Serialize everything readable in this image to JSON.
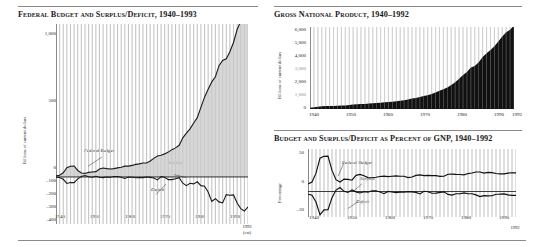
{
  "page": {
    "background": "#ffffff",
    "accent": "#111111",
    "fill_gray": "#c9c9c9",
    "fill_black": "#111111",
    "grid_color": "#c4c4c4"
  },
  "charts": [
    {
      "id": "federal-budget",
      "title": "Federal Budget and Surplus/Deficit, 1940–1993",
      "ylabel": "Billions of current dollars",
      "xlabel": "",
      "type": "area",
      "grid": "vertical-yearly",
      "ylim": [
        -400,
        1300
      ],
      "xlim": [
        1940,
        1993
      ],
      "yticks": [
        "1,000",
        "500",
        "0",
        "–100",
        "–200",
        "–300",
        "–400"
      ],
      "ytick_values": [
        1000,
        500,
        0,
        -100,
        -200,
        -300,
        -400
      ],
      "xticks": [
        "1940",
        "1950",
        "1960",
        "1970",
        "1980",
        "1990"
      ],
      "xtick_values": [
        1940,
        1950,
        1960,
        1970,
        1980,
        1990
      ],
      "endnote": "1993\n(est)",
      "endnote_line1": "1993",
      "endnote_line2": "(est)",
      "series_labels": [
        {
          "name": "Federal Budget",
          "text": "Federal Budget"
        },
        {
          "name": "Surplus",
          "text": "Surplus"
        },
        {
          "name": "Deficit",
          "text": "Deficit"
        }
      ],
      "series": [
        {
          "name": "Federal Budget",
          "x": [
            1940,
            1941,
            1942,
            1943,
            1944,
            1945,
            1946,
            1947,
            1948,
            1949,
            1950,
            1951,
            1952,
            1953,
            1954,
            1955,
            1956,
            1957,
            1958,
            1959,
            1960,
            1961,
            1962,
            1963,
            1964,
            1965,
            1966,
            1967,
            1968,
            1969,
            1970,
            1971,
            1972,
            1973,
            1974,
            1975,
            1976,
            1977,
            1978,
            1979,
            1980,
            1981,
            1982,
            1983,
            1984,
            1985,
            1986,
            1987,
            1988,
            1989,
            1990,
            1991,
            1992,
            1993
          ],
          "values": [
            9,
            14,
            35,
            78,
            91,
            93,
            55,
            34,
            30,
            39,
            42,
            45,
            68,
            76,
            71,
            68,
            71,
            77,
            82,
            92,
            92,
            98,
            107,
            111,
            119,
            118,
            135,
            158,
            178,
            184,
            196,
            211,
            232,
            247,
            269,
            332,
            372,
            409,
            459,
            504,
            591,
            678,
            746,
            808,
            852,
            946,
            990,
            1004,
            1064,
            1143,
            1253,
            1324,
            1382,
            1468
          ]
        },
        {
          "name": "Surplus/Deficit",
          "x": [
            1940,
            1941,
            1942,
            1943,
            1944,
            1945,
            1946,
            1947,
            1948,
            1949,
            1950,
            1951,
            1952,
            1953,
            1954,
            1955,
            1956,
            1957,
            1958,
            1959,
            1960,
            1961,
            1962,
            1963,
            1964,
            1965,
            1966,
            1967,
            1968,
            1969,
            1970,
            1971,
            1972,
            1973,
            1974,
            1975,
            1976,
            1977,
            1978,
            1979,
            1980,
            1981,
            1982,
            1983,
            1984,
            1985,
            1986,
            1987,
            1988,
            1989,
            1990,
            1991,
            1992,
            1993
          ],
          "values": [
            -3,
            -5,
            -20,
            -55,
            -48,
            -48,
            -16,
            4,
            12,
            1,
            -3,
            6,
            -2,
            -6,
            -1,
            -3,
            4,
            3,
            -3,
            -13,
            0,
            -3,
            -7,
            -5,
            -6,
            -1,
            -4,
            -9,
            -25,
            3,
            -3,
            -23,
            -23,
            -15,
            -6,
            -53,
            -74,
            -54,
            -59,
            -41,
            -74,
            -79,
            -128,
            -208,
            -185,
            -212,
            -221,
            -150,
            -155,
            -153,
            -221,
            -269,
            -290,
            -255
          ]
        }
      ]
    },
    {
      "id": "gross-national-product",
      "title": "Gross National Product, 1940–1992",
      "ylabel": "Billions of current dollars",
      "xlabel": "",
      "type": "area",
      "grid": "vertical-yearly",
      "ylim": [
        0,
        6200
      ],
      "xlim": [
        1940,
        1992
      ],
      "yticks": [
        "6,000",
        "5,000",
        "4,000",
        "3,000",
        "2,000",
        "1,000",
        "0"
      ],
      "ytick_values": [
        6000,
        5000,
        4000,
        3000,
        2000,
        1000,
        0
      ],
      "xticks": [
        "1940",
        "1950",
        "1960",
        "1970",
        "1980",
        "1990",
        "1992"
      ],
      "xtick_values": [
        1940,
        1950,
        1960,
        1970,
        1980,
        1990,
        1992
      ],
      "series": [
        {
          "name": "GNP",
          "x": [
            1940,
            1941,
            1942,
            1943,
            1944,
            1945,
            1946,
            1947,
            1948,
            1949,
            1950,
            1951,
            1952,
            1953,
            1954,
            1955,
            1956,
            1957,
            1958,
            1959,
            1960,
            1961,
            1962,
            1963,
            1964,
            1965,
            1966,
            1967,
            1968,
            1969,
            1970,
            1971,
            1972,
            1973,
            1974,
            1975,
            1976,
            1977,
            1978,
            1979,
            1980,
            1981,
            1982,
            1983,
            1984,
            1985,
            1986,
            1987,
            1988,
            1989,
            1990,
            1991,
            1992
          ],
          "values": [
            101,
            126,
            162,
            199,
            220,
            223,
            222,
            244,
            270,
            267,
            294,
            339,
            358,
            379,
            381,
            415,
            438,
            461,
            467,
            507,
            527,
            545,
            586,
            618,
            664,
            720,
            788,
            833,
            910,
            985,
            1039,
            1128,
            1241,
            1386,
            1501,
            1635,
            1824,
            2031,
            2295,
            2566,
            2796,
            3131,
            3259,
            3535,
            3933,
            4213,
            4453,
            4742,
            5108,
            5489,
            5803,
            5986,
            6319
          ]
        }
      ]
    },
    {
      "id": "budget-percent-gnp",
      "title": "Budget and Surplus/Deficit as Percent of GNP, 1940–1992",
      "ylabel": "Percentage",
      "xlabel": "",
      "type": "line",
      "grid": "vertical-yearly",
      "ylim": [
        -30,
        50
      ],
      "xlim": [
        1940,
        1992
      ],
      "yticks": [
        "50",
        "0",
        "–30"
      ],
      "ytick_values": [
        50,
        0,
        -30
      ],
      "xticks": [
        "1940",
        "1950",
        "1960",
        "1970",
        "1980",
        "1990"
      ],
      "xtick_values": [
        1940,
        1950,
        1960,
        1970,
        1980,
        1990
      ],
      "endnote_line1": "1992",
      "series_labels": [
        {
          "name": "Federal Budget",
          "text": "Federal Budget"
        },
        {
          "name": "Surplus",
          "text": "Surplus"
        },
        {
          "name": "Deficit",
          "text": "Deficit"
        }
      ],
      "series": [
        {
          "name": "Federal Budget",
          "x": [
            1940,
            1941,
            1942,
            1943,
            1944,
            1945,
            1946,
            1947,
            1948,
            1949,
            1950,
            1951,
            1952,
            1953,
            1954,
            1955,
            1956,
            1957,
            1958,
            1959,
            1960,
            1961,
            1962,
            1963,
            1964,
            1965,
            1966,
            1967,
            1968,
            1969,
            1970,
            1971,
            1972,
            1973,
            1974,
            1975,
            1976,
            1977,
            1978,
            1979,
            1980,
            1981,
            1982,
            1983,
            1984,
            1985,
            1986,
            1987,
            1988,
            1989,
            1990,
            1991,
            1992
          ],
          "values": [
            9.0,
            11.1,
            21.6,
            39.2,
            41.4,
            41.7,
            24.8,
            13.9,
            11.1,
            14.6,
            14.3,
            13.3,
            19.0,
            20.1,
            18.6,
            16.4,
            16.2,
            16.7,
            17.6,
            18.1,
            17.5,
            18.0,
            18.3,
            18.0,
            17.9,
            16.4,
            17.1,
            19.0,
            19.6,
            18.7,
            18.9,
            18.7,
            18.7,
            17.8,
            17.9,
            20.3,
            20.4,
            20.1,
            20.0,
            19.6,
            21.1,
            21.7,
            22.9,
            22.9,
            21.7,
            22.5,
            22.2,
            21.2,
            20.8,
            20.8,
            21.6,
            22.1,
            21.9
          ]
        },
        {
          "name": "Surplus/Deficit",
          "x": [
            1940,
            1941,
            1942,
            1943,
            1944,
            1945,
            1946,
            1947,
            1948,
            1949,
            1950,
            1951,
            1952,
            1953,
            1954,
            1955,
            1956,
            1957,
            1958,
            1959,
            1960,
            1961,
            1962,
            1963,
            1964,
            1965,
            1966,
            1967,
            1968,
            1969,
            1970,
            1971,
            1972,
            1973,
            1974,
            1975,
            1976,
            1977,
            1978,
            1979,
            1980,
            1981,
            1982,
            1983,
            1984,
            1985,
            1986,
            1987,
            1988,
            1989,
            1990,
            1991,
            1992
          ],
          "values": [
            -3.0,
            -4.3,
            -12.3,
            -27.5,
            -21.6,
            -21.5,
            -7.2,
            1.7,
            4.6,
            0.2,
            -1.1,
            1.9,
            -0.4,
            -1.7,
            -0.3,
            -0.8,
            0.9,
            0.8,
            -0.6,
            -2.6,
            0.1,
            -0.6,
            -1.3,
            -0.8,
            -0.9,
            -0.2,
            -0.5,
            -1.1,
            -2.9,
            0.3,
            -0.3,
            -2.1,
            -1.9,
            -1.1,
            -0.4,
            -3.4,
            -4.2,
            -2.7,
            -2.6,
            -1.6,
            -2.7,
            -2.6,
            -4.0,
            -6.0,
            -4.8,
            -5.1,
            -5.0,
            -3.2,
            -3.1,
            -2.8,
            -3.9,
            -4.5,
            -4.6
          ]
        }
      ]
    }
  ]
}
